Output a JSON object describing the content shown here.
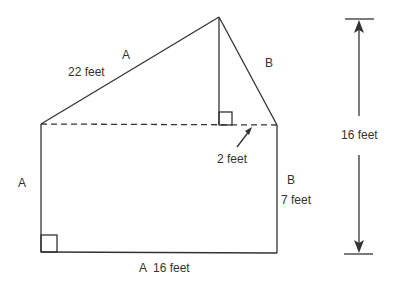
{
  "diagram": {
    "type": "composite-shape-area",
    "labels": {
      "slant_left_letter": "A",
      "slant_left_length": "22 feet",
      "slant_right_letter": "B",
      "left_side_letter": "A",
      "right_side_letter": "B",
      "right_side_length": "7 feet",
      "bottom_label": "A  16 feet",
      "offset_length": "2 feet",
      "total_height": "16 feet"
    },
    "colors": {
      "stroke": "#333333",
      "background": "#ffffff"
    }
  }
}
